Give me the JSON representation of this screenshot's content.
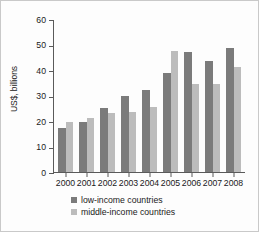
{
  "chart_data": {
    "type": "bar",
    "title": "",
    "subtitle": "",
    "xlabel": "",
    "ylabel": "US$, billions",
    "categories": [
      "2000",
      "2001",
      "2002",
      "2003",
      "2004",
      "2005",
      "2006",
      "2007",
      "2008"
    ],
    "series": [
      {
        "name": "low-income countries",
        "color": "#7b7b7b",
        "values": [
          17.3,
          19.5,
          25.0,
          29.8,
          32.3,
          39.0,
          47.0,
          43.5,
          48.5
        ]
      },
      {
        "name": "middle-income countries",
        "color": "#bcbcbc",
        "values": [
          19.6,
          21.0,
          23.0,
          23.4,
          25.6,
          47.5,
          34.5,
          34.5,
          41.2
        ]
      }
    ],
    "ylim": [
      0,
      60
    ],
    "yticks": [
      "0",
      "10",
      "20",
      "30",
      "40",
      "50",
      "60"
    ],
    "ytick_values": [
      0,
      10,
      20,
      30,
      40,
      50,
      60
    ],
    "grid": false,
    "legend_position": "bottom",
    "annotations": []
  },
  "legend": {
    "entries": [
      {
        "label": "low-income countries",
        "swatch": "low"
      },
      {
        "label": "middle-income countries",
        "swatch": "mid"
      }
    ]
  },
  "colors": {
    "low_income": "#7b7b7b",
    "middle_income": "#bcbcbc",
    "axis": "#5a5a5a",
    "text": "#1a1a1a",
    "frame": "#c9c9c9",
    "background": "#fdfdfd"
  }
}
